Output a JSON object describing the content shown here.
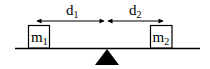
{
  "diagram": {
    "colors": {
      "ink": "#000000",
      "background": "#ffffff"
    },
    "distances": [
      {
        "id": "d1",
        "label_main": "d",
        "label_sub": "1"
      },
      {
        "id": "d2",
        "label_main": "d",
        "label_sub": "2"
      }
    ],
    "masses": [
      {
        "id": "m1",
        "label_main": "m",
        "label_sub": "1",
        "side": "left"
      },
      {
        "id": "m2",
        "label_main": "m",
        "label_sub": "2",
        "side": "right"
      }
    ],
    "fulcrum": {
      "shape": "triangle",
      "fill": "#000000"
    },
    "beam": {
      "shape": "horizontal-line"
    }
  }
}
